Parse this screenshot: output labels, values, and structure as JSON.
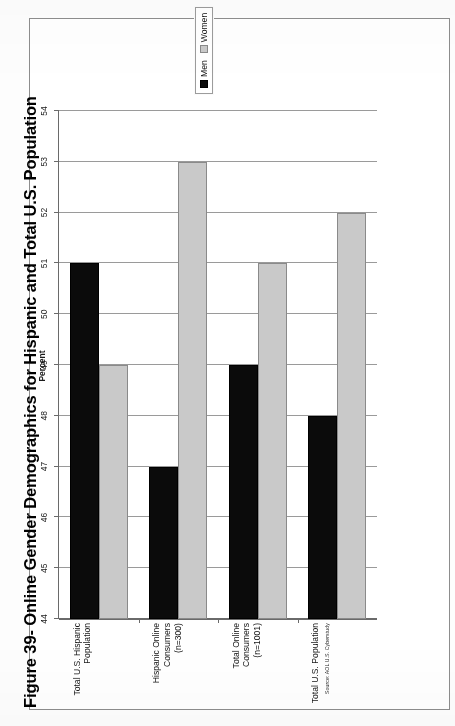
{
  "figure": {
    "title": "Figure 39- Online Gender Demographics for Hispanic and Total U.S. Population",
    "source_note": "Source: AOL U.S. Cyberstudy"
  },
  "legend": {
    "position": "right",
    "entries": [
      {
        "label": "Men",
        "color": "#0b0b0b"
      },
      {
        "label": "Women",
        "color": "#c9c9c9"
      }
    ]
  },
  "chart_data": {
    "type": "bar",
    "orientation": "horizontal",
    "title": "Figure 39- Online Gender Demographics for Hispanic and Total U.S. Population",
    "xlabel": "Percent",
    "ylabel": "",
    "xlim": [
      44,
      54
    ],
    "xticks": [
      44,
      45,
      46,
      47,
      48,
      49,
      50,
      51,
      52,
      53,
      54
    ],
    "grid": true,
    "categories": [
      "Total U.S. Hispanic\nPopulation",
      "Hispanic Online Consumers\n(n=300)",
      "Total Online Consumers\n(n=1001)",
      "Total U.S. Population"
    ],
    "series": [
      {
        "name": "Men",
        "color": "#0b0b0b",
        "values": [
          51,
          47,
          49,
          48
        ]
      },
      {
        "name": "Women",
        "color": "#c9c9c9",
        "values": [
          49,
          53,
          51,
          52
        ]
      }
    ],
    "annotations": [
      "Source: AOL U.S. Cyberstudy"
    ],
    "legend_entries": [
      "Men",
      "Women"
    ]
  }
}
